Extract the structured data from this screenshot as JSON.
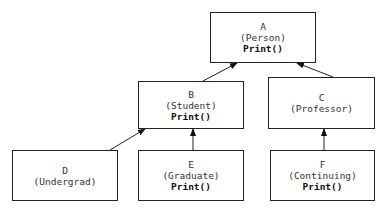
{
  "diagram": {
    "type": "class-inheritance-hierarchy",
    "nodes": [
      {
        "id": "A",
        "label": "A",
        "class": "(Person)",
        "method": "Print()"
      },
      {
        "id": "B",
        "label": "B",
        "class": "(Student)",
        "method": "Print()"
      },
      {
        "id": "C",
        "label": "C",
        "class": "(Professor)",
        "method": ""
      },
      {
        "id": "D",
        "label": "D",
        "class": "(Undergrad)",
        "method": ""
      },
      {
        "id": "E",
        "label": "E",
        "class": "(Graduate)",
        "method": "Print()"
      },
      {
        "id": "F",
        "label": "F",
        "class": "(Continuing)",
        "method": "Print()"
      }
    ],
    "edges": [
      {
        "from": "B",
        "to": "A"
      },
      {
        "from": "C",
        "to": "A"
      },
      {
        "from": "D",
        "to": "B"
      },
      {
        "from": "E",
        "to": "B"
      },
      {
        "from": "F",
        "to": "C"
      }
    ]
  }
}
